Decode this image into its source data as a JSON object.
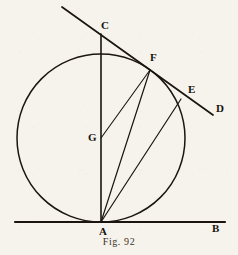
{
  "figure": {
    "caption": "Fig. 92",
    "ink_color": "#1a1510",
    "paper_color": "#f6f3ec",
    "labels": {
      "A": "A",
      "B": "B",
      "C": "C",
      "D": "D",
      "E": "E",
      "F": "F",
      "G": "G"
    }
  },
  "chart_data": {
    "type": "diagram",
    "title": "Fig. 92",
    "xlim": [
      0,
      238
    ],
    "ylim": [
      255,
      0
    ],
    "grid": false,
    "legend": null,
    "points": [
      {
        "name": "A",
        "x": 101,
        "y": 222,
        "label": "A",
        "label_x": 99,
        "label_y": 226
      },
      {
        "name": "B",
        "x": 225,
        "y": 222,
        "label": "B",
        "label_x": 212,
        "label_y": 223
      },
      {
        "name": "C",
        "x": 101,
        "y": 38,
        "label": "C",
        "label_x": 101,
        "label_y": 20
      },
      {
        "name": "D",
        "x": 213,
        "y": 115,
        "label": "D",
        "label_x": 216,
        "label_y": 103
      },
      {
        "name": "E",
        "x": 181,
        "y": 99,
        "label": "E",
        "label_x": 188,
        "label_y": 84
      },
      {
        "name": "F",
        "x": 150,
        "y": 70,
        "label": "F",
        "label_x": 150,
        "label_y": 52
      },
      {
        "name": "G",
        "x": 101,
        "y": 138,
        "label": "G",
        "label_x": 88,
        "label_y": 132
      }
    ],
    "circle": {
      "center_x": 101,
      "center_y": 138,
      "radius": 84
    },
    "segments": [
      {
        "name": "tangent-line-AB",
        "x1": 15,
        "y1": 222,
        "x2": 225,
        "y2": 222
      },
      {
        "name": "diameter-CA",
        "x1": 101,
        "y1": 34,
        "x2": 101,
        "y2": 222
      },
      {
        "name": "secant-line-CD",
        "x1": 62,
        "y1": 7,
        "x2": 213,
        "y2": 115
      },
      {
        "name": "chord-AF",
        "x1": 101,
        "y1": 222,
        "x2": 150,
        "y2": 70
      },
      {
        "name": "chord-AE",
        "x1": 101,
        "y1": 222,
        "x2": 181,
        "y2": 99
      },
      {
        "name": "radius-GF",
        "x1": 101,
        "y1": 138,
        "x2": 150,
        "y2": 70
      }
    ]
  }
}
